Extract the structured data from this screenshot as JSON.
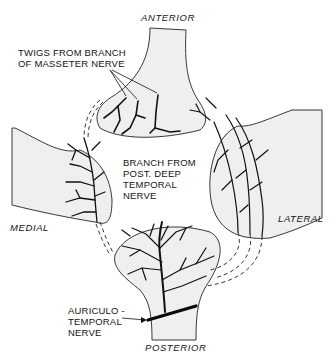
{
  "diagram": {
    "type": "anatomical-illustration",
    "directions": {
      "anterior": "ANTERIOR",
      "posterior": "POSTERIOR",
      "medial": "MEDIAL",
      "lateral": "LATERAL"
    },
    "labels": {
      "masseter_line1": "TWIGS FROM BRANCH",
      "masseter_line2": "OF MASSETER NERVE",
      "deep_temporal_line1": "BRANCH FROM",
      "deep_temporal_line2": "POST. DEEP",
      "deep_temporal_line3": "TEMPORAL",
      "deep_temporal_line4": "NERVE",
      "auriculo_line1": "AURICULO -",
      "auriculo_line2": "TEMPORAL",
      "auriculo_line3": "NERVE"
    },
    "colors": {
      "background": "#ffffff",
      "tissue_fill": "#efefef",
      "ink": "#111111"
    }
  }
}
